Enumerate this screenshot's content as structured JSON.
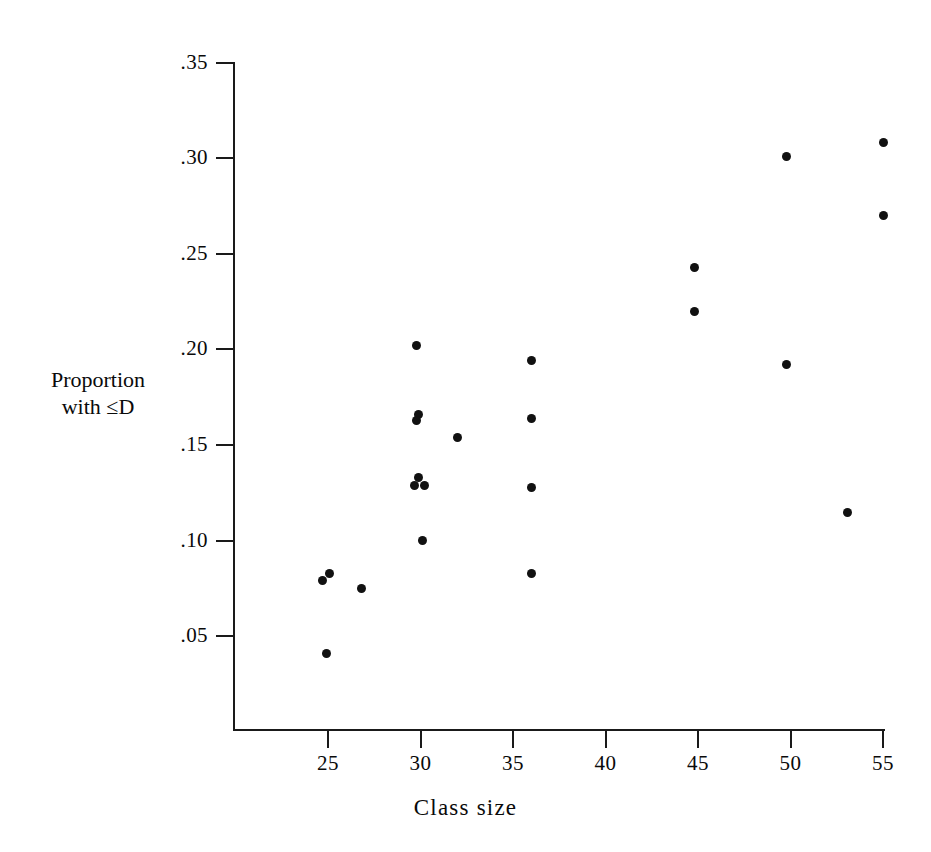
{
  "chart_data": {
    "type": "scatter",
    "title": "",
    "xlabel": "Class size",
    "ylabel": "Proportion with ≤D",
    "xlim": [
      21.3,
      56.4
    ],
    "ylim": [
      0.0,
      0.3625
    ],
    "grid": false,
    "legend": null,
    "xticks": [
      25,
      30,
      35,
      40,
      45,
      50,
      55
    ],
    "xtick_labels": [
      "25",
      "30",
      "35",
      "40",
      "45",
      "50",
      "55"
    ],
    "yticks": [
      0.05,
      0.1,
      0.15,
      0.2,
      0.25,
      0.3,
      0.35
    ],
    "ytick_labels": [
      ".05",
      ".10",
      ".15",
      ".20",
      ".25",
      ".30",
      ".35"
    ],
    "marker": "filled-circle",
    "marker_color": "#111111",
    "points": [
      {
        "x": 24.9,
        "y": 0.041
      },
      {
        "x": 24.7,
        "y": 0.079
      },
      {
        "x": 25.1,
        "y": 0.083
      },
      {
        "x": 26.8,
        "y": 0.075
      },
      {
        "x": 29.8,
        "y": 0.202
      },
      {
        "x": 29.9,
        "y": 0.166
      },
      {
        "x": 29.8,
        "y": 0.163
      },
      {
        "x": 29.9,
        "y": 0.133
      },
      {
        "x": 29.7,
        "y": 0.129
      },
      {
        "x": 30.2,
        "y": 0.129
      },
      {
        "x": 30.1,
        "y": 0.1
      },
      {
        "x": 32.0,
        "y": 0.154
      },
      {
        "x": 36.0,
        "y": 0.194
      },
      {
        "x": 36.0,
        "y": 0.164
      },
      {
        "x": 36.0,
        "y": 0.128
      },
      {
        "x": 36.0,
        "y": 0.083
      },
      {
        "x": 44.8,
        "y": 0.243
      },
      {
        "x": 44.8,
        "y": 0.22
      },
      {
        "x": 49.8,
        "y": 0.301
      },
      {
        "x": 49.8,
        "y": 0.192
      },
      {
        "x": 53.1,
        "y": 0.115
      },
      {
        "x": 55.0,
        "y": 0.308
      },
      {
        "x": 55.0,
        "y": 0.27
      }
    ]
  },
  "axes": {
    "y_title_line1": "Proportion",
    "y_title_line2": "with ≤D",
    "x_title_word1": "Class",
    "x_title_word2": "size"
  }
}
